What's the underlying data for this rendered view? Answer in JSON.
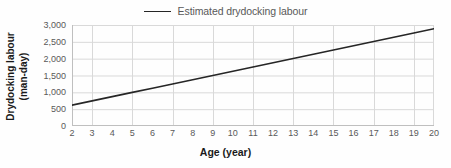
{
  "chart_data": {
    "type": "line",
    "title": "",
    "xlabel": "Age (year)",
    "ylabel": "Drydocking labour (man-day)",
    "ylabel_line1": "Drydocking labour",
    "ylabel_line2": "(man-day)",
    "legend_position": "top-center",
    "grid": {
      "horizontal": true,
      "vertical": true,
      "vertical_step": 2,
      "color": "#d9d9d9"
    },
    "xlim": [
      2,
      20
    ],
    "ylim": [
      0,
      3000
    ],
    "x_ticks": [
      2,
      3,
      4,
      5,
      6,
      7,
      8,
      9,
      10,
      11,
      12,
      13,
      14,
      15,
      16,
      17,
      18,
      19,
      20
    ],
    "x_tick_labels": [
      "2",
      "3",
      "4",
      "5",
      "6",
      "7",
      "8",
      "9",
      "10",
      "11",
      "12",
      "13",
      "14",
      "15",
      "16",
      "17",
      "18",
      "19",
      "20"
    ],
    "y_ticks": [
      0,
      500,
      1000,
      1500,
      2000,
      2500,
      3000
    ],
    "y_tick_labels": [
      "0",
      "500",
      "1,000",
      "1,500",
      "2,000",
      "2,500",
      "3,000"
    ],
    "y_gridlines": [
      500,
      1000,
      1500,
      2000,
      2500,
      3000
    ],
    "x_gridlines": [
      3,
      5,
      7,
      9,
      11,
      13,
      15,
      17,
      19
    ],
    "series": [
      {
        "name": "Estimated drydocking labour",
        "color": "#262626",
        "width": 1.6,
        "x": [
          2,
          3,
          4,
          5,
          6,
          7,
          8,
          9,
          10,
          11,
          12,
          13,
          14,
          15,
          16,
          17,
          18,
          19,
          20
        ],
        "values": [
          620,
          746,
          872,
          998,
          1124,
          1250,
          1376,
          1502,
          1628,
          1754,
          1880,
          2006,
          2132,
          2258,
          2384,
          2510,
          2636,
          2762,
          2888
        ]
      }
    ]
  },
  "legend": {
    "items": [
      {
        "label": "Estimated drydocking labour",
        "color": "#262626"
      }
    ]
  },
  "colors": {
    "background": "#fefefe",
    "axis": "#bfbfbf",
    "grid": "#d9d9d9",
    "tick_text": "#595959",
    "title_text": "#1a1a1a",
    "series": "#262626"
  }
}
